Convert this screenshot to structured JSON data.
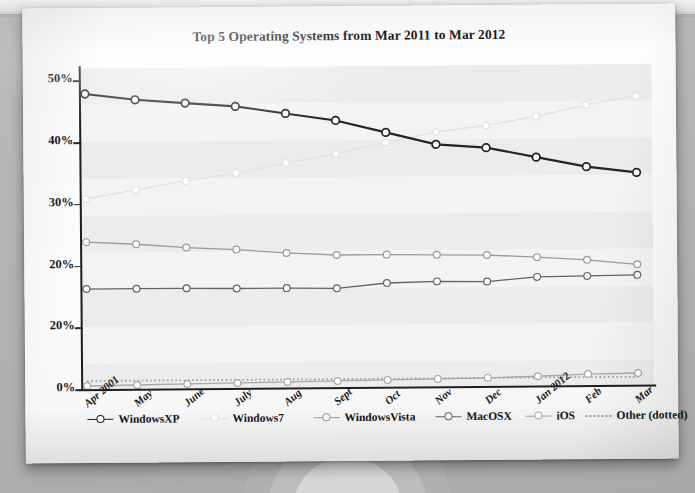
{
  "chart_data": {
    "type": "line",
    "title": "Top 5 Operating Systems from Mar 2011 to Mar 2012",
    "xlabel": "",
    "ylabel": "",
    "categories": [
      "Apr 2001",
      "May",
      "June",
      "July",
      "Aug",
      "Sept",
      "Oct",
      "Nov",
      "Dec",
      "Jan 2012",
      "Feb",
      "Mar"
    ],
    "ytick_labels": [
      "50%",
      "40%",
      "30%",
      "20%",
      "20%",
      "0%"
    ],
    "ytick_values": [
      50,
      40,
      30,
      20,
      10,
      0
    ],
    "ylim": [
      0,
      52
    ],
    "grid": "alternating horizontal bands",
    "legend_position": "bottom",
    "series": [
      {
        "name": "WindowsXP",
        "color": "#232323",
        "marker": "open-circle",
        "style": "solid",
        "values": [
          47.8,
          46.8,
          46.2,
          45.6,
          44.4,
          43.2,
          41.2,
          39.2,
          38.6,
          37.0,
          35.4,
          34.4
        ]
      },
      {
        "name": "Windows7",
        "color": "#e2e2e2",
        "marker": "open-circle",
        "style": "solid",
        "values": [
          30.8,
          32.2,
          33.6,
          34.8,
          36.4,
          37.8,
          39.6,
          41.2,
          42.2,
          43.6,
          45.4,
          46.8
        ]
      },
      {
        "name": "WindowsVista",
        "color": "#9a9a9a",
        "marker": "open-circle",
        "style": "solid",
        "values": [
          23.8,
          23.4,
          22.8,
          22.4,
          21.8,
          21.4,
          21.4,
          21.3,
          21.2,
          20.8,
          20.3,
          19.5
        ]
      },
      {
        "name": "MacOSX",
        "color": "#636363",
        "marker": "open-circle",
        "style": "solid",
        "values": [
          16.2,
          16.2,
          16.2,
          16.1,
          16.1,
          16.0,
          16.8,
          17.0,
          16.9,
          17.6,
          17.7,
          17.8
        ]
      },
      {
        "name": "iOS",
        "color": "#a8a8a8",
        "marker": "open-circle",
        "style": "solid",
        "values": [
          0.5,
          0.6,
          0.7,
          0.8,
          0.9,
          1.0,
          1.1,
          1.2,
          1.3,
          1.5,
          1.8,
          1.9
        ]
      },
      {
        "name": "Other (dotted)",
        "color": "#9d9d9d",
        "marker": "none",
        "style": "dotted",
        "values": [
          1.3,
          1.3,
          1.3,
          1.3,
          1.3,
          1.3,
          1.3,
          1.3,
          1.3,
          1.3,
          1.3,
          1.3
        ]
      }
    ]
  },
  "legend": {
    "items": [
      {
        "label": "WindowsXP",
        "color": "#232323",
        "dotted": false
      },
      {
        "label": "Windows7",
        "color": "#e4e4e4",
        "dotted": false
      },
      {
        "label": "WindowsVista",
        "color": "#9a9a9a",
        "dotted": false
      },
      {
        "label": "MacOSX",
        "color": "#636363",
        "dotted": false
      },
      {
        "label": "iOS",
        "color": "#a8a8a8",
        "dotted": false
      },
      {
        "label": "Other (dotted)",
        "color": "#9d9d9d",
        "dotted": true
      }
    ]
  }
}
